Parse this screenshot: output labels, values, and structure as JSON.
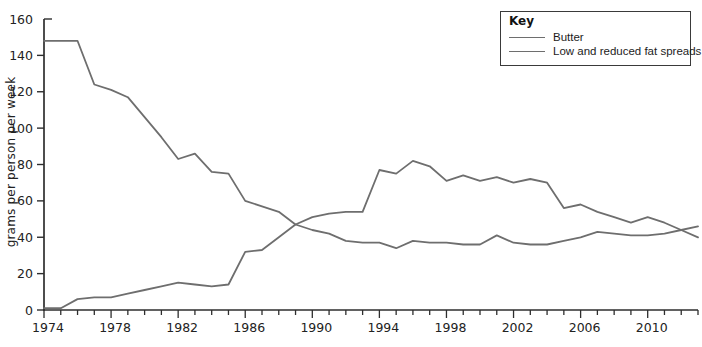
{
  "chart_data": {
    "type": "line",
    "title": "",
    "xlabel": "",
    "ylabel": "grams per person per week",
    "ylim": [
      0,
      160
    ],
    "ytick_step": 20,
    "grid": false,
    "legend_title": "Key",
    "legend_position": "top-right",
    "axis_color": "#2e2e2e",
    "line_color": "#6e6e6e",
    "x": [
      1974,
      1975,
      1976,
      1977,
      1978,
      1979,
      1980,
      1981,
      1982,
      1983,
      1984,
      1985,
      1986,
      1987,
      1988,
      1989,
      1990,
      1991,
      1992,
      1993,
      1994,
      1995,
      1996,
      1997,
      1998,
      1999,
      2000,
      2001,
      2002,
      2003,
      2004,
      2005,
      2006,
      2007,
      2008,
      2009,
      2010,
      2011,
      2012,
      2013
    ],
    "xtick_labels": [
      1974,
      1978,
      1982,
      1986,
      1990,
      1994,
      1998,
      2002,
      2006,
      2010
    ],
    "series": [
      {
        "name": "Butter",
        "values": [
          148,
          148,
          148,
          124,
          121,
          117,
          106,
          95,
          83,
          86,
          76,
          75,
          60,
          57,
          54,
          47,
          44,
          42,
          38,
          37,
          37,
          34,
          38,
          37,
          37,
          36,
          36,
          41,
          37,
          36,
          36,
          38,
          40,
          43,
          42,
          41,
          41,
          42,
          44,
          46
        ]
      },
      {
        "name": "Low and reduced fat spreads",
        "values": [
          1,
          1,
          6,
          7,
          7,
          9,
          11,
          13,
          15,
          14,
          13,
          14,
          32,
          33,
          40,
          47,
          51,
          53,
          54,
          54,
          77,
          75,
          82,
          79,
          71,
          74,
          71,
          73,
          70,
          72,
          70,
          56,
          58,
          54,
          51,
          48,
          51,
          48,
          44,
          40
        ]
      }
    ]
  }
}
